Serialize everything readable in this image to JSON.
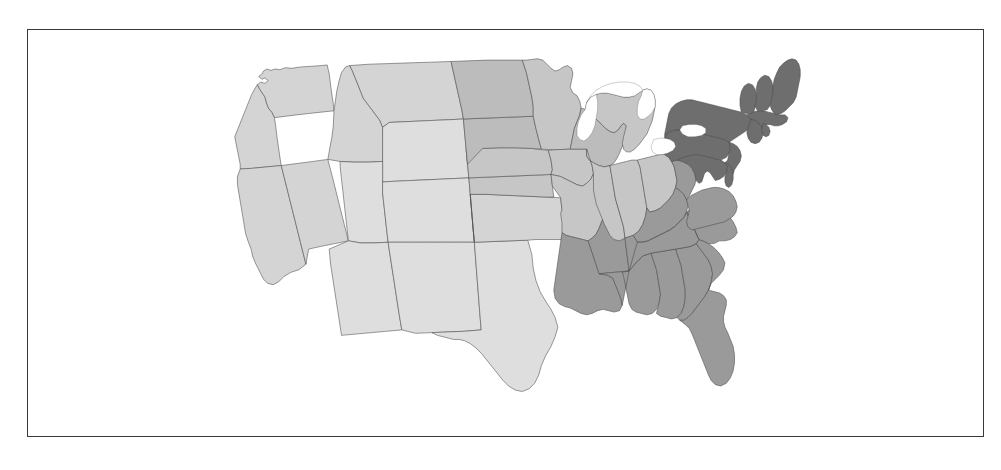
{
  "figure": {
    "type": "choropleth-map",
    "region": "United States (contiguous 48 states)",
    "frame_border_color": "#3a3a3a",
    "background_color": "#ffffff",
    "state_border_color": "#4a4a4a",
    "water_color": "#ffffff"
  },
  "legend": {
    "shown": false,
    "title": "",
    "entries": []
  },
  "chart_data": {
    "type": "heatmap",
    "title": "",
    "subtitle": "",
    "xlabel": "",
    "ylabel": "",
    "grid": false,
    "legend_position": "none",
    "palette": {
      "bins": [
        {
          "label": "lowest",
          "color": "#dedede",
          "value": 1
        },
        {
          "label": "low",
          "color": "#d4d4d4",
          "value": 2
        },
        {
          "label": "low-mid",
          "color": "#c6c6c6",
          "value": 3
        },
        {
          "label": "mid",
          "color": "#bcbcbc",
          "value": 4
        },
        {
          "label": "mid-high",
          "color": "#a8a8a8",
          "value": 5
        },
        {
          "label": "high",
          "color": "#9a9a9a",
          "value": 6
        },
        {
          "label": "highest",
          "color": "#6e6e6e",
          "value": 7
        }
      ]
    },
    "categories": [
      "WA",
      "OR",
      "CA",
      "NV",
      "ID",
      "MT",
      "WY",
      "UT",
      "CO",
      "AZ",
      "NM",
      "TX",
      "OK",
      "KS",
      "NE",
      "SD",
      "ND",
      "MN",
      "IA",
      "MO",
      "AR",
      "LA",
      "WI",
      "IL",
      "MI",
      "IN",
      "OH",
      "KY",
      "TN",
      "MS",
      "AL",
      "GA",
      "FL",
      "SC",
      "NC",
      "VA",
      "WV",
      "MD",
      "DE",
      "PA",
      "NJ",
      "NY",
      "CT",
      "RI",
      "MA",
      "VT",
      "NH",
      "ME"
    ],
    "values": [
      2,
      2,
      2,
      2,
      2,
      2,
      2,
      1,
      1,
      1,
      1,
      1,
      2,
      3,
      3,
      4,
      4,
      3,
      3,
      3,
      6,
      6,
      4,
      3,
      3,
      3,
      3,
      6,
      6,
      6,
      6,
      6,
      6,
      6,
      6,
      6,
      6,
      7,
      7,
      7,
      7,
      7,
      7,
      7,
      7,
      7,
      7,
      7
    ],
    "colors": [
      "#d4d4d4",
      "#d4d4d4",
      "#d4d4d4",
      "#d4d4d4",
      "#d4d4d4",
      "#d4d4d4",
      "#d4d4d4",
      "#dedede",
      "#dedede",
      "#dedede",
      "#dedede",
      "#dedede",
      "#d4d4d4",
      "#c6c6c6",
      "#c6c6c6",
      "#bcbcbc",
      "#bcbcbc",
      "#c6c6c6",
      "#c6c6c6",
      "#c6c6c6",
      "#9a9a9a",
      "#9a9a9a",
      "#bcbcbc",
      "#c6c6c6",
      "#c6c6c6",
      "#c6c6c6",
      "#c6c6c6",
      "#9a9a9a",
      "#9a9a9a",
      "#9a9a9a",
      "#9a9a9a",
      "#9a9a9a",
      "#9a9a9a",
      "#9a9a9a",
      "#9a9a9a",
      "#9a9a9a",
      "#9a9a9a",
      "#6e6e6e",
      "#6e6e6e",
      "#6e6e6e",
      "#6e6e6e",
      "#6e6e6e",
      "#6e6e6e",
      "#6e6e6e",
      "#6e6e6e",
      "#6e6e6e",
      "#6e6e6e",
      "#6e6e6e"
    ]
  },
  "states": [
    {
      "code": "WA",
      "name": "Washington",
      "color": "#d4d4d4",
      "bin": 2
    },
    {
      "code": "OR",
      "name": "Oregon",
      "color": "#d4d4d4",
      "bin": 2
    },
    {
      "code": "CA",
      "name": "California",
      "color": "#d4d4d4",
      "bin": 2
    },
    {
      "code": "NV",
      "name": "Nevada",
      "color": "#d4d4d4",
      "bin": 2
    },
    {
      "code": "ID",
      "name": "Idaho",
      "color": "#d4d4d4",
      "bin": 2
    },
    {
      "code": "MT",
      "name": "Montana",
      "color": "#d4d4d4",
      "bin": 2
    },
    {
      "code": "WY",
      "name": "Wyoming",
      "color": "#dedede",
      "bin": 1
    },
    {
      "code": "UT",
      "name": "Utah",
      "color": "#dedede",
      "bin": 1
    },
    {
      "code": "CO",
      "name": "Colorado",
      "color": "#dedede",
      "bin": 1
    },
    {
      "code": "AZ",
      "name": "Arizona",
      "color": "#dedede",
      "bin": 1
    },
    {
      "code": "NM",
      "name": "New Mexico",
      "color": "#dedede",
      "bin": 1
    },
    {
      "code": "TX",
      "name": "Texas",
      "color": "#dedede",
      "bin": 1
    },
    {
      "code": "OK",
      "name": "Oklahoma",
      "color": "#d4d4d4",
      "bin": 2
    },
    {
      "code": "KS",
      "name": "Kansas",
      "color": "#c6c6c6",
      "bin": 3
    },
    {
      "code": "NE",
      "name": "Nebraska",
      "color": "#c6c6c6",
      "bin": 3
    },
    {
      "code": "SD",
      "name": "South Dakota",
      "color": "#bcbcbc",
      "bin": 4
    },
    {
      "code": "ND",
      "name": "North Dakota",
      "color": "#bcbcbc",
      "bin": 4
    },
    {
      "code": "MN",
      "name": "Minnesota",
      "color": "#c6c6c6",
      "bin": 3
    },
    {
      "code": "IA",
      "name": "Iowa",
      "color": "#c6c6c6",
      "bin": 3
    },
    {
      "code": "MO",
      "name": "Missouri",
      "color": "#c6c6c6",
      "bin": 3
    },
    {
      "code": "AR",
      "name": "Arkansas",
      "color": "#9a9a9a",
      "bin": 6
    },
    {
      "code": "LA",
      "name": "Louisiana",
      "color": "#9a9a9a",
      "bin": 6
    },
    {
      "code": "WI",
      "name": "Wisconsin",
      "color": "#bcbcbc",
      "bin": 4
    },
    {
      "code": "IL",
      "name": "Illinois",
      "color": "#c6c6c6",
      "bin": 3
    },
    {
      "code": "MI",
      "name": "Michigan",
      "color": "#c6c6c6",
      "bin": 3
    },
    {
      "code": "IN",
      "name": "Indiana",
      "color": "#c6c6c6",
      "bin": 3
    },
    {
      "code": "OH",
      "name": "Ohio",
      "color": "#c6c6c6",
      "bin": 3
    },
    {
      "code": "KY",
      "name": "Kentucky",
      "color": "#9a9a9a",
      "bin": 6
    },
    {
      "code": "TN",
      "name": "Tennessee",
      "color": "#9a9a9a",
      "bin": 6
    },
    {
      "code": "MS",
      "name": "Mississippi",
      "color": "#9a9a9a",
      "bin": 6
    },
    {
      "code": "AL",
      "name": "Alabama",
      "color": "#9a9a9a",
      "bin": 6
    },
    {
      "code": "GA",
      "name": "Georgia",
      "color": "#9a9a9a",
      "bin": 6
    },
    {
      "code": "FL",
      "name": "Florida",
      "color": "#9a9a9a",
      "bin": 6
    },
    {
      "code": "SC",
      "name": "South Carolina",
      "color": "#9a9a9a",
      "bin": 6
    },
    {
      "code": "NC",
      "name": "North Carolina",
      "color": "#9a9a9a",
      "bin": 6
    },
    {
      "code": "VA",
      "name": "Virginia",
      "color": "#9a9a9a",
      "bin": 6
    },
    {
      "code": "WV",
      "name": "West Virginia",
      "color": "#9a9a9a",
      "bin": 6
    },
    {
      "code": "MD",
      "name": "Maryland",
      "color": "#6e6e6e",
      "bin": 7
    },
    {
      "code": "DE",
      "name": "Delaware",
      "color": "#6e6e6e",
      "bin": 7
    },
    {
      "code": "PA",
      "name": "Pennsylvania",
      "color": "#6e6e6e",
      "bin": 7
    },
    {
      "code": "NJ",
      "name": "New Jersey",
      "color": "#6e6e6e",
      "bin": 7
    },
    {
      "code": "NY",
      "name": "New York",
      "color": "#6e6e6e",
      "bin": 7
    },
    {
      "code": "CT",
      "name": "Connecticut",
      "color": "#6e6e6e",
      "bin": 7
    },
    {
      "code": "RI",
      "name": "Rhode Island",
      "color": "#6e6e6e",
      "bin": 7
    },
    {
      "code": "MA",
      "name": "Massachusetts",
      "color": "#6e6e6e",
      "bin": 7
    },
    {
      "code": "VT",
      "name": "Vermont",
      "color": "#6e6e6e",
      "bin": 7
    },
    {
      "code": "NH",
      "name": "New Hampshire",
      "color": "#6e6e6e",
      "bin": 7
    },
    {
      "code": "ME",
      "name": "Maine",
      "color": "#6e6e6e",
      "bin": 7
    }
  ],
  "water_bodies": [
    {
      "name": "Lake Michigan"
    },
    {
      "name": "Lake Superior"
    },
    {
      "name": "Lake Huron"
    },
    {
      "name": "Lake Erie"
    },
    {
      "name": "Lake Ontario"
    }
  ]
}
